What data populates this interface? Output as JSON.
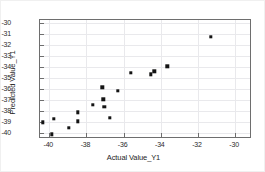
{
  "chart_data": {
    "type": "scatter",
    "title": "",
    "xlabel": "Actual Value_Y1",
    "ylabel": "Predicted Value_Y1",
    "xlim": [
      -40.5,
      -29.2
    ],
    "ylim": [
      -40.4,
      -29.7
    ],
    "xticks": [
      -40,
      -38,
      -36,
      -34,
      -32,
      -30
    ],
    "yticks": [
      -30,
      -31,
      -32,
      -33,
      -34,
      -35,
      -36,
      -37,
      -38,
      -39,
      -40
    ],
    "xtick_labels": [
      "-40",
      "-38",
      "-36",
      "-34",
      "-32",
      "-30"
    ],
    "ytick_labels": [
      "-30",
      "-31",
      "-32",
      "-33",
      "-34",
      "-35",
      "-36",
      "-37",
      "-38",
      "-39",
      "-40"
    ],
    "grid": true,
    "legend": "none",
    "marker": "square",
    "marker_color": "#141414",
    "grid_color": "#e9e9ec",
    "frame_color": "#6e6e6e",
    "background": "#ffffff",
    "points": [
      {
        "x": -40.35,
        "y": -39.05
      },
      {
        "x": -39.85,
        "y": -40.15
      },
      {
        "x": -39.75,
        "y": -38.75
      },
      {
        "x": -38.95,
        "y": -39.55
      },
      {
        "x": -38.45,
        "y": -38.15
      },
      {
        "x": -38.45,
        "y": -38.95
      },
      {
        "x": -37.65,
        "y": -37.45
      },
      {
        "x": -37.15,
        "y": -35.85
      },
      {
        "x": -37.1,
        "y": -36.95
      },
      {
        "x": -37.05,
        "y": -37.65
      },
      {
        "x": -36.75,
        "y": -38.65
      },
      {
        "x": -36.3,
        "y": -36.15
      },
      {
        "x": -35.6,
        "y": -34.55
      },
      {
        "x": -34.55,
        "y": -34.65
      },
      {
        "x": -34.35,
        "y": -34.4
      },
      {
        "x": -33.65,
        "y": -33.95
      },
      {
        "x": -31.3,
        "y": -31.25
      }
    ]
  }
}
